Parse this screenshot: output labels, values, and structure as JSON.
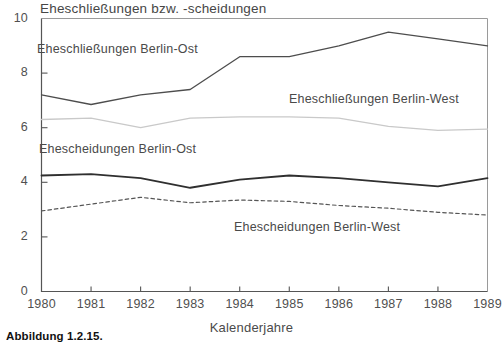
{
  "figure": {
    "caption": "Abbildung 1.2.15."
  },
  "chart_data": {
    "type": "line",
    "title": "Eheschließungen bzw. -scheidungen",
    "xlabel": "Kalenderjahre",
    "ylabel": "",
    "x": [
      1980,
      1981,
      1982,
      1983,
      1984,
      1985,
      1986,
      1987,
      1988,
      1989
    ],
    "categories": [
      "1980",
      "1981",
      "1982",
      "1983",
      "1984",
      "1985",
      "1986",
      "1987",
      "1988",
      "1989"
    ],
    "xlim": [
      1980,
      1989
    ],
    "ylim": [
      0,
      10
    ],
    "yticks": [
      0,
      2,
      4,
      6,
      8,
      10
    ],
    "ytick_labels": [
      "0",
      "2",
      "4",
      "6",
      "8",
      "10"
    ],
    "grid": false,
    "legend": "inline-annotations",
    "series": [
      {
        "name": "Eheschließungen Berlin-Ost",
        "style": "solid",
        "color": "#4d4d4d",
        "width": 1.3,
        "values": [
          7.2,
          6.85,
          7.2,
          7.4,
          8.6,
          8.6,
          9.0,
          9.5,
          9.25,
          9.0
        ]
      },
      {
        "name": "Eheschließungen Berlin-West",
        "style": "solid",
        "color": "#c9c9c9",
        "width": 1.3,
        "values": [
          6.3,
          6.35,
          6.0,
          6.35,
          6.4,
          6.4,
          6.35,
          6.05,
          5.9,
          5.95
        ]
      },
      {
        "name": "Ehescheidungen Berlin-Ost",
        "style": "solid",
        "color": "#2f2f2f",
        "width": 1.8,
        "values": [
          4.25,
          4.3,
          4.15,
          3.8,
          4.1,
          4.25,
          4.15,
          4.0,
          3.85,
          4.15
        ]
      },
      {
        "name": "Ehescheidungen Berlin-West",
        "style": "dashed",
        "color": "#555555",
        "width": 1.2,
        "values": [
          2.95,
          3.2,
          3.45,
          3.25,
          3.35,
          3.3,
          3.15,
          3.05,
          2.9,
          2.8
        ]
      }
    ],
    "annotations": [
      {
        "name": "marriages-east",
        "text": "Eheschließungen  Berlin-Ost"
      },
      {
        "name": "marriages-west",
        "text": "Eheschließungen Berlin-West"
      },
      {
        "name": "divorces-east",
        "text": "Ehescheidungen Berlin-Ost"
      },
      {
        "name": "divorces-west",
        "text": "Ehescheidungen Berlin-West"
      }
    ]
  }
}
